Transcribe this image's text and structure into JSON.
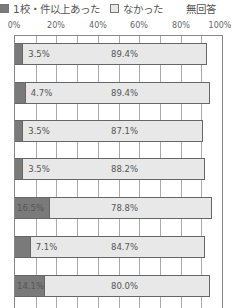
{
  "chart_data": {
    "type": "bar",
    "orientation": "horizontal",
    "stacked": true,
    "title": "",
    "xlabel": "",
    "ylabel": "",
    "xlim": [
      0,
      100
    ],
    "grid": true,
    "legend_position": "top",
    "tick_labels": [
      "0%",
      "20%",
      "40%",
      "60%",
      "80%",
      "100%"
    ],
    "categories": [
      "",
      "",
      "",
      "",
      "",
      "",
      ""
    ],
    "series": [
      {
        "name": "1校・件以上あった",
        "color": "#7a7a7a",
        "values": [
          3.5,
          4.7,
          3.5,
          3.5,
          16.5,
          7.1,
          14.1
        ]
      },
      {
        "name": "なかった",
        "color": "#e8e8e8",
        "values": [
          89.4,
          89.4,
          87.1,
          88.2,
          78.8,
          84.7,
          80.0
        ]
      },
      {
        "name": "無回答",
        "color": "#ffffff",
        "values": [
          7.1,
          5.9,
          9.4,
          8.3,
          4.7,
          8.2,
          5.9
        ]
      }
    ],
    "labels": {
      "s1": [
        "3.5%",
        "4.7%",
        "3.5%",
        "3.5%",
        "16.5%",
        "7.1%",
        "14.1%"
      ],
      "s2": [
        "89.4%",
        "89.4%",
        "87.1%",
        "88.2%",
        "78.8%",
        "84.7%",
        "80.0%"
      ]
    }
  },
  "legend": [
    {
      "label": "1校・件以上あった",
      "color": "#7a7a7a"
    },
    {
      "label": "なかった",
      "color": "#e8e8e8"
    },
    {
      "label": "無回答",
      "color": "#ffffff"
    }
  ]
}
